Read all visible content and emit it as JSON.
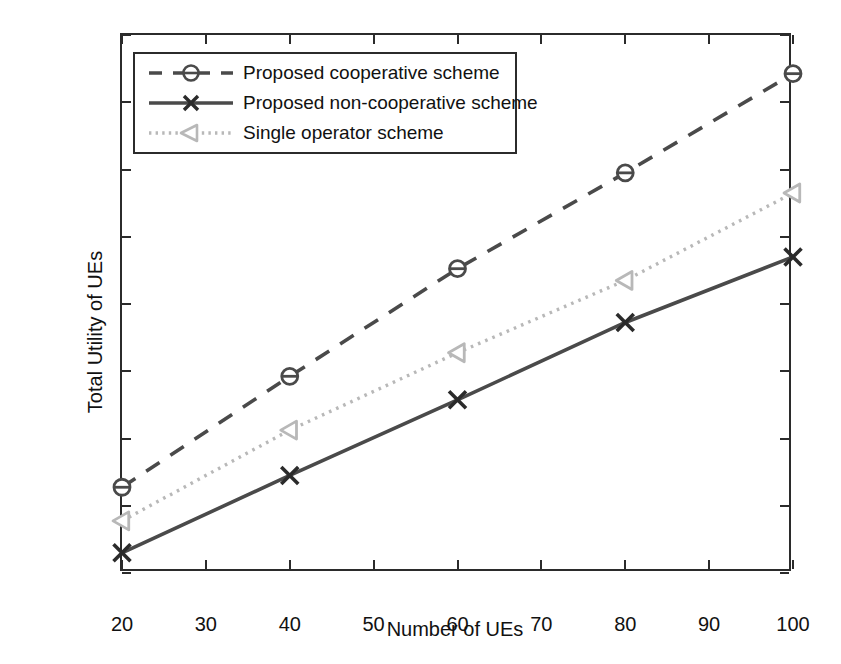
{
  "chart_data": {
    "type": "line",
    "title": "",
    "xlabel": "Number of UEs",
    "ylabel": "Total Utility of UEs",
    "x": [
      20,
      40,
      60,
      80,
      100
    ],
    "xlim": [
      20,
      100
    ],
    "ylim": [
      20,
      180
    ],
    "xticks": [
      20,
      30,
      40,
      50,
      60,
      70,
      80,
      90,
      100
    ],
    "yticks": [
      20,
      40,
      60,
      80,
      100,
      120,
      140,
      160,
      180
    ],
    "grid": false,
    "legend_position": "upper left",
    "series": [
      {
        "name": "Proposed cooperative scheme",
        "values": [
          45.5,
          78.5,
          110.5,
          139,
          168.5
        ],
        "color": "#4a4a4a",
        "linestyle": "dashed",
        "marker": "circle"
      },
      {
        "name": "Proposed non-cooperative scheme",
        "values": [
          26,
          49,
          71.5,
          94.5,
          114
        ],
        "color": "#4a4a4a",
        "linestyle": "solid",
        "marker": "x"
      },
      {
        "name": "Single operator scheme",
        "values": [
          35.5,
          62.5,
          85.5,
          107,
          133
        ],
        "color": "#b8b8b8",
        "linestyle": "dotted",
        "marker": "triangle-left"
      }
    ]
  },
  "axis": {
    "y_title": "Total Utility of UEs",
    "x_title": "Number of UEs",
    "y_tick_labels": [
      "20",
      "40",
      "60",
      "80",
      "100",
      "120",
      "140",
      "160",
      "180"
    ],
    "x_tick_labels": [
      "20",
      "30",
      "40",
      "50",
      "60",
      "70",
      "80",
      "90",
      "100"
    ]
  },
  "legend": {
    "items": [
      {
        "label": "Proposed cooperative scheme"
      },
      {
        "label": "Proposed non-cooperative scheme"
      },
      {
        "label": "Single operator scheme"
      }
    ]
  }
}
